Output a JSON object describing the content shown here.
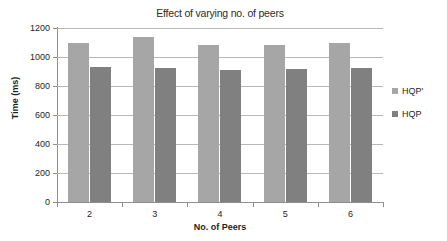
{
  "chart_data": {
    "type": "bar",
    "title": "Effect of varying no. of peers",
    "xlabel": "No. of Peers",
    "ylabel": "Time (ms)",
    "categories": [
      "2",
      "3",
      "4",
      "5",
      "6"
    ],
    "ylim": [
      0,
      1200
    ],
    "ytick_step": 200,
    "ytick_labels": [
      "1200",
      "1000",
      "800",
      "600",
      "400",
      "200",
      "0"
    ],
    "ytick_values": [
      1200,
      1000,
      800,
      600,
      400,
      200,
      0
    ],
    "grid": true,
    "legend_position": "right",
    "series": [
      {
        "name": "HQP'",
        "color": "#a6a6a6",
        "values": [
          1095,
          1135,
          1080,
          1080,
          1095
        ]
      },
      {
        "name": "HQP",
        "color": "#808080",
        "values": [
          930,
          925,
          910,
          918,
          922
        ]
      }
    ]
  },
  "legend": {
    "items": [
      {
        "label": "HQP'",
        "color": "#a6a6a6"
      },
      {
        "label": "HQP",
        "color": "#808080"
      }
    ]
  }
}
